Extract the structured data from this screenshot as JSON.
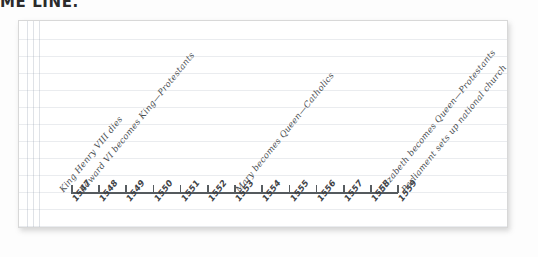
{
  "heading": {
    "text": "ME LINE."
  },
  "timeline": {
    "axis_label": "years",
    "years": [
      "1547",
      "1548",
      "1549",
      "1550",
      "1551",
      "1552",
      "1553",
      "1554",
      "1555",
      "1556",
      "1557",
      "1558",
      "1559"
    ],
    "events": [
      {
        "year": "1547",
        "text": "King Henry VIII dies"
      },
      {
        "year": "1547",
        "text": "Edward VI becomes King—Protestants"
      },
      {
        "year": "1553",
        "text": "Mary becomes Queen—Catholics"
      },
      {
        "year": "1558",
        "text": "Elizabeth becomes Queen—Protestants"
      },
      {
        "year": "1559",
        "text": "Parliament sets up national church"
      }
    ]
  },
  "colors": {
    "ink": "#4a4e52",
    "axis": "#555a5e",
    "rule_line": "#96a0af",
    "heading": "#2b2b2b",
    "paper": "#ffffff"
  }
}
